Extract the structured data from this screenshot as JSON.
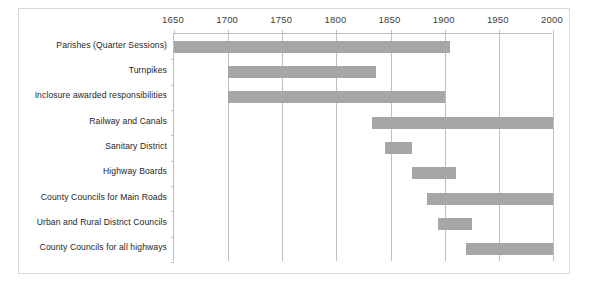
{
  "chart_data": {
    "type": "bar",
    "orientation": "horizontal",
    "subtype": "gantt-timeline",
    "title": "",
    "xlabel": "",
    "ylabel": "",
    "xlim": [
      1650,
      2000
    ],
    "x_ticks": [
      1650,
      1700,
      1750,
      1800,
      1850,
      1900,
      1950,
      2000
    ],
    "x_tick_labels": [
      "1650",
      "1700",
      "1750",
      "1800",
      "1850",
      "1900",
      "1950",
      "2000"
    ],
    "grid": "vertical",
    "legend": "none",
    "bar_color": "#a6a6a6",
    "gridline_color": "#bfbfbf",
    "border_color": "#d9d9d9",
    "categories": [
      "Parishes (Quarter Sessions)",
      "Turnpikes",
      "Inclosure awarded responsibilities",
      "Railway and Canals",
      "Sanitary District",
      "Highway Boards",
      "County Councils for Main Roads",
      "Urban and Rural District Councils",
      "County Councils for all highways"
    ],
    "spans": [
      {
        "label": "Parishes (Quarter Sessions)",
        "start": 1650,
        "end": 1905
      },
      {
        "label": "Turnpikes",
        "start": 1700,
        "end": 1837
      },
      {
        "label": "Inclosure awarded responsibilities",
        "start": 1700,
        "end": 1900
      },
      {
        "label": "Railway and Canals",
        "start": 1833,
        "end": 2000
      },
      {
        "label": "Sanitary District",
        "start": 1845,
        "end": 1870
      },
      {
        "label": "Highway Boards",
        "start": 1870,
        "end": 1910
      },
      {
        "label": "County Councils for Main Roads",
        "start": 1884,
        "end": 2000
      },
      {
        "label": "Urban and Rural District Councils",
        "start": 1894,
        "end": 1925
      },
      {
        "label": "County Councils for all highways",
        "start": 1920,
        "end": 2000
      }
    ]
  }
}
